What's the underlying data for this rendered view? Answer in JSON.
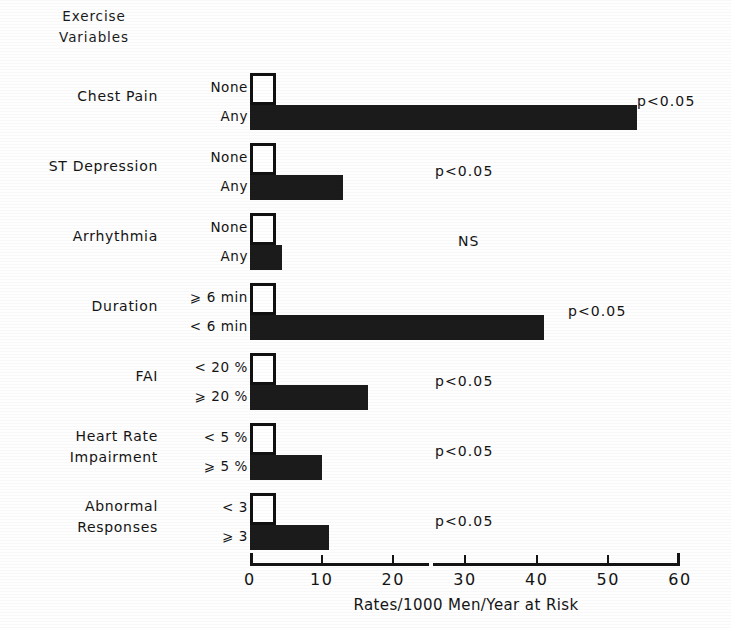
{
  "header": {
    "line1": "Exercise",
    "line2": "Variables"
  },
  "chart_data": {
    "type": "bar",
    "orientation": "horizontal",
    "title": "",
    "xlabel": "Rates/1000 Men/Year at Risk",
    "ylabel": "Exercise Variables",
    "xlim": [
      0,
      60
    ],
    "xticks": [
      0,
      10,
      20,
      30,
      40,
      50,
      60
    ],
    "xticklabels": [
      "0",
      "10",
      "20",
      "30",
      "40",
      "50",
      "60"
    ],
    "grid": false,
    "legend": "none",
    "groups": [
      {
        "name": "Chest Pain",
        "name_line1": "Chest Pain",
        "name_line2": "",
        "significance": "p<0.05",
        "bars": [
          {
            "label": "None",
            "value": 3.5,
            "style": "open"
          },
          {
            "label": "Any",
            "value": 54.0,
            "style": "filled"
          }
        ]
      },
      {
        "name": "ST Depression",
        "name_line1": "ST Depression",
        "name_line2": "",
        "significance": "p<0.05",
        "bars": [
          {
            "label": "None",
            "value": 3.0,
            "style": "open"
          },
          {
            "label": "Any",
            "value": 13.0,
            "style": "filled"
          }
        ]
      },
      {
        "name": "Arrhythmia",
        "name_line1": "Arrhythmia",
        "name_line2": "",
        "significance": "NS",
        "bars": [
          {
            "label": "None",
            "value": 3.5,
            "style": "open"
          },
          {
            "label": "Any",
            "value": 4.5,
            "style": "filled"
          }
        ]
      },
      {
        "name": "Duration",
        "name_line1": "Duration",
        "name_line2": "",
        "significance": "p<0.05",
        "bars": [
          {
            "label": "⩾ 6 min",
            "value": 3.5,
            "style": "open"
          },
          {
            "label": "< 6 min",
            "value": 41.0,
            "style": "filled"
          }
        ]
      },
      {
        "name": "FAI",
        "name_line1": "FAI",
        "name_line2": "",
        "significance": "p<0.05",
        "bars": [
          {
            "label": "< 20 %",
            "value": 3.0,
            "style": "open"
          },
          {
            "label": "⩾ 20 %",
            "value": 16.5,
            "style": "filled"
          }
        ]
      },
      {
        "name": "Heart Rate Impairment",
        "name_line1": "Heart Rate",
        "name_line2": "Impairment",
        "significance": "p<0.05",
        "bars": [
          {
            "label": "< 5 %",
            "value": 2.7,
            "style": "open"
          },
          {
            "label": "⩾ 5 %",
            "value": 10.0,
            "style": "filled"
          }
        ]
      },
      {
        "name": "Abnormal Responses",
        "name_line1": "Abnormal",
        "name_line2": "Responses",
        "significance": "p<0.05",
        "bars": [
          {
            "label": "< 3",
            "value": 3.0,
            "style": "open"
          },
          {
            "label": "⩾ 3",
            "value": 11.0,
            "style": "filled"
          }
        ]
      }
    ]
  },
  "colors": {
    "bar_filled": "#1b1b1b",
    "bar_open_fill": "#ffffff",
    "bar_outline": "#111111",
    "axis": "#141414",
    "background": "#ffffff"
  }
}
